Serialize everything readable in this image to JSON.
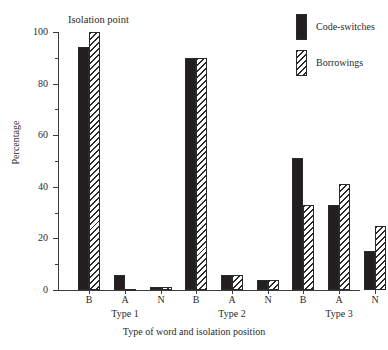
{
  "chart_data": {
    "type": "bar",
    "title": "Isolation point",
    "xlabel": "Type of word and isolation position",
    "ylabel": "Percentage",
    "ylim": [
      0,
      100
    ],
    "ytick_step": 20,
    "yminor_step": 10,
    "grid": false,
    "legend_position": "top-right",
    "categories": [
      "B",
      "A",
      "N",
      "B",
      "A",
      "N",
      "B",
      "A",
      "N"
    ],
    "groups": [
      {
        "label": "Type 1",
        "categories": [
          "B",
          "A",
          "N"
        ]
      },
      {
        "label": "Type 2",
        "categories": [
          "B",
          "A",
          "N"
        ]
      },
      {
        "label": "Type 3",
        "categories": [
          "B",
          "A",
          "N"
        ]
      }
    ],
    "yticks": [
      {
        "value": 100,
        "label": "100"
      },
      {
        "value": 80,
        "label": "80"
      },
      {
        "value": 60,
        "label": "60"
      },
      {
        "value": 40,
        "label": "40"
      },
      {
        "value": 20,
        "label": "20"
      },
      {
        "value": 0,
        "label": "0"
      }
    ],
    "series": [
      {
        "name": "Code-switches",
        "pattern": "solid",
        "color": "#231f20",
        "values": [
          94,
          6,
          1,
          90,
          6,
          4,
          51,
          33,
          15
        ]
      },
      {
        "name": "Borrowings",
        "pattern": "diagonal-hatch",
        "color": "#ffffff",
        "values": [
          100,
          0.5,
          1,
          90,
          6,
          4,
          33,
          41,
          25
        ]
      }
    ]
  },
  "legend": {
    "items": [
      {
        "label": "Code-switches",
        "pattern": "solid"
      },
      {
        "label": "Borrowings",
        "pattern": "diagonal-hatch"
      }
    ]
  }
}
